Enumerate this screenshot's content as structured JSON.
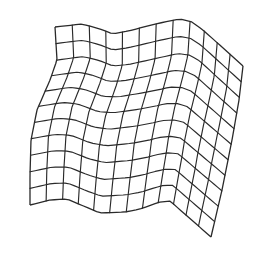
{
  "diagram": {
    "type": "warped-grid-surface",
    "rows": 11,
    "cols": 12,
    "stroke_color": "#2a2a2a",
    "background": "#ffffff",
    "corners": {
      "top_left": [
        55,
        27
      ],
      "top_right": [
        243,
        66
      ],
      "bottom_right": [
        211,
        237
      ],
      "bottom_left": [
        30,
        205
      ]
    },
    "top_edge": [
      [
        55,
        27
      ],
      [
        82,
        24
      ],
      [
        100,
        29
      ],
      [
        113,
        34
      ],
      [
        128,
        31
      ],
      [
        160,
        23
      ],
      [
        180,
        19
      ],
      [
        192,
        22
      ],
      [
        203,
        30
      ],
      [
        243,
        66
      ]
    ],
    "bottom_edge": [
      [
        30,
        205
      ],
      [
        50,
        200
      ],
      [
        67,
        199
      ],
      [
        100,
        213
      ],
      [
        125,
        212
      ],
      [
        140,
        209
      ],
      [
        160,
        202
      ],
      [
        170,
        201
      ],
      [
        211,
        237
      ]
    ],
    "left_edge": [
      [
        55,
        27
      ],
      [
        57,
        60
      ],
      [
        50,
        80
      ],
      [
        37,
        110
      ],
      [
        31,
        140
      ],
      [
        30,
        175
      ],
      [
        30,
        205
      ]
    ],
    "right_edge": [
      [
        243,
        66
      ],
      [
        239,
        100
      ],
      [
        232,
        140
      ],
      [
        222,
        190
      ],
      [
        211,
        237
      ]
    ]
  }
}
